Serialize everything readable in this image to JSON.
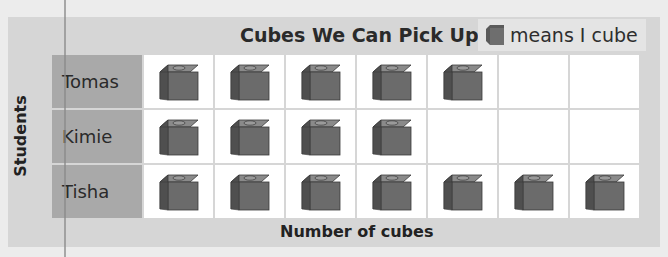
{
  "chart_data": {
    "type": "table",
    "title": "Cubes We Can Pick Up",
    "legend": {
      "icon": "cube-icon",
      "text": "means I cube",
      "value": 1
    },
    "xlabel": "Number of cubes",
    "ylabel": "Students",
    "categories": [
      "Tomas",
      "Kimie",
      "Tisha"
    ],
    "values": [
      5,
      4,
      7
    ],
    "columns": 7
  },
  "colors": {
    "cube_front": "#6b6b6b",
    "cube_top": "#8a8a8a",
    "cube_side": "#4f4f4f",
    "label_bg": "#a9a9a9",
    "panel_bg": "#d6d6d6"
  }
}
